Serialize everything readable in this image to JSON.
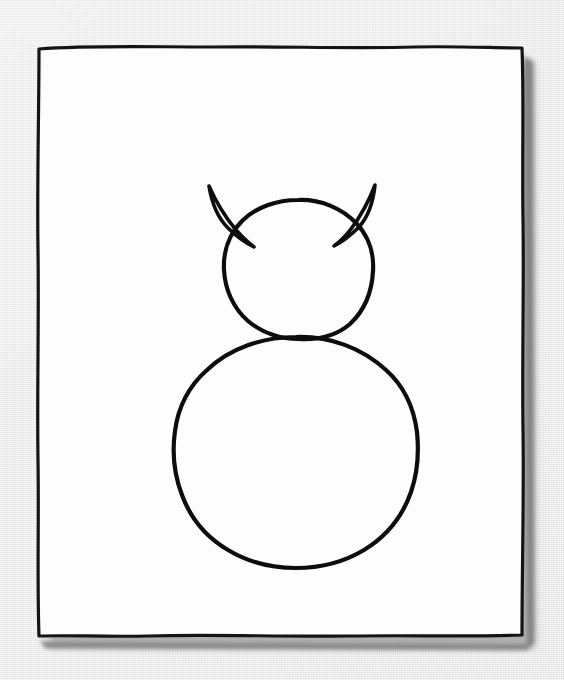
{
  "scene": {
    "title": "Hand-drawn cat sketch on paper",
    "width": 564,
    "height": 680,
    "background_color": "#e9e9e9",
    "background_description": "light gray textured surface"
  },
  "paper": {
    "name": "sketch-paper",
    "fill_color": "#fdfdfd",
    "border_color": "#141414",
    "border_style": "hand-drawn wavy rectangle",
    "shadow_color": "#8a8a8a",
    "bounds": {
      "left": 38,
      "top": 47,
      "right": 523,
      "bottom": 636
    }
  },
  "drawing": {
    "name": "cat-figure",
    "ink_color": "#0d0d0d",
    "stroke_weight": 4,
    "description": "Two stacked hand-drawn circles forming a head and body, with two pointed triangular ears on the head",
    "parts": [
      {
        "name": "head-circle",
        "shape": "circle",
        "center": [
          298,
          269
        ],
        "radius": 70
      },
      {
        "name": "left-ear",
        "shape": "triangle",
        "apex": [
          208,
          185
        ]
      },
      {
        "name": "right-ear",
        "shape": "triangle",
        "apex": [
          375,
          184
        ]
      },
      {
        "name": "body-circle",
        "shape": "circle",
        "center": [
          296,
          452
        ],
        "radius": 122
      }
    ]
  }
}
